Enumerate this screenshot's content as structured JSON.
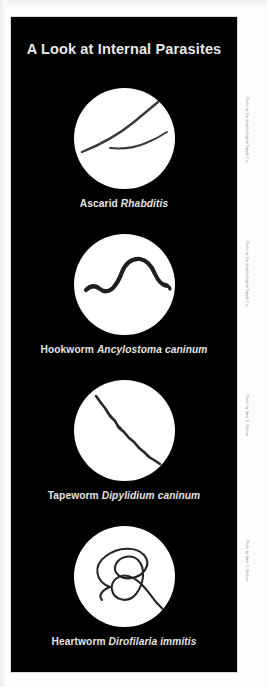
{
  "page": {
    "background_color": "#fdfdfd",
    "panel_color": "#000000",
    "title_color": "#e8e8e8",
    "caption_color": "#e4e4e4",
    "credit_color": "#8d8d8d"
  },
  "header": {
    "title": "A Look at Internal Parasites"
  },
  "figures": [
    {
      "common_name": "Ascarid",
      "scientific_name": "Rhabditis",
      "specimen_description": "two slender dark worms crossing a white microscope field"
    },
    {
      "common_name": "Hookworm",
      "scientific_name": "Ancylostoma caninum",
      "specimen_description": "single thick arched dark worm on a white field"
    },
    {
      "common_name": "Tapeworm",
      "scientific_name": "Dipylidium caninum",
      "specimen_description": "thin segmented chain running diagonally across a white field"
    },
    {
      "common_name": "Heartworm",
      "scientific_name": "Dirofilaria immitis",
      "specimen_description": "long thread-like worm coiled into a tangle on a white field"
    }
  ],
  "credits": [
    "Photo by Carolina Biological Supply Co.",
    "Photo by Carolina Biological Supply Co.",
    "Photo by Jane C. Nelson",
    "Photo by Jane C. Nelson"
  ]
}
